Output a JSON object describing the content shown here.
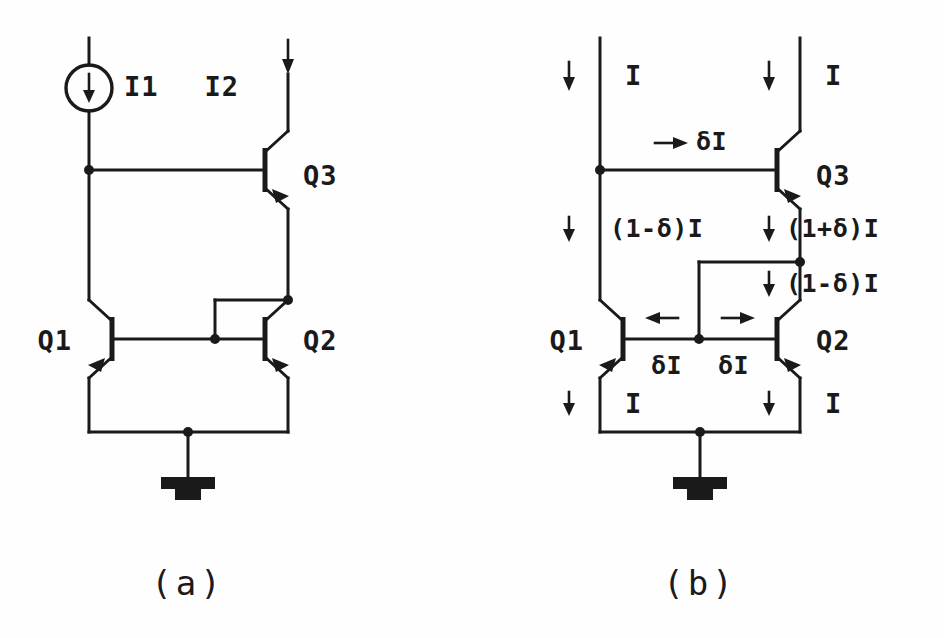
{
  "figure": {
    "background_color": "#ffffff",
    "ink_color": "#1a1a1a"
  },
  "panels": [
    {
      "id": "panel-a",
      "caption": "(a)",
      "devices": [
        {
          "name": "current-source",
          "label": "I1",
          "type": "current-source",
          "arrow": "down"
        },
        {
          "name": "input-branch",
          "label": "I2",
          "type": "input-current",
          "arrow": "down"
        },
        {
          "name": "transistor-q3",
          "label": "Q3",
          "type": "npn"
        },
        {
          "name": "transistor-q1",
          "label": "Q1",
          "type": "npn-mirrored"
        },
        {
          "name": "transistor-q2",
          "label": "Q2",
          "type": "npn"
        },
        {
          "name": "ground",
          "label": "",
          "type": "ground"
        }
      ]
    },
    {
      "id": "panel-b",
      "caption": "(b)",
      "devices": [
        {
          "name": "transistor-q3",
          "label": "Q3",
          "type": "npn"
        },
        {
          "name": "transistor-q1",
          "label": "Q1",
          "type": "npn-mirrored"
        },
        {
          "name": "transistor-q2",
          "label": "Q2",
          "type": "npn"
        },
        {
          "name": "ground",
          "label": "",
          "type": "ground"
        }
      ],
      "current_labels": [
        {
          "name": "current-left-top",
          "text": "I",
          "arrow": "down"
        },
        {
          "name": "current-right-top",
          "text": "I",
          "arrow": "down"
        },
        {
          "name": "current-base-q3",
          "text": "δI",
          "arrow": "right"
        },
        {
          "name": "current-left-mid",
          "text": "(1-δ)I",
          "arrow": "down"
        },
        {
          "name": "current-right-mid",
          "text": "(1+δ)I",
          "arrow": "down"
        },
        {
          "name": "current-right-lower",
          "text": "(1-δ)I",
          "arrow": "down"
        },
        {
          "name": "current-base-q1",
          "text": "δI",
          "arrow": "left"
        },
        {
          "name": "current-base-q2",
          "text": "δI",
          "arrow": "right"
        },
        {
          "name": "current-emitter-left",
          "text": "I",
          "arrow": "down"
        },
        {
          "name": "current-emitter-right",
          "text": "I",
          "arrow": "down"
        }
      ]
    }
  ],
  "labels": {
    "a": {
      "i1": "I1",
      "i2": "I2",
      "q3": "Q3",
      "q1": "Q1",
      "q2": "Q2",
      "caption": "(a)"
    },
    "b": {
      "i_left_top": "I",
      "i_right_top": "I",
      "delta_i_base_q3": "δI",
      "left_mid": "(1-δ)I",
      "right_mid": "(1+δ)I",
      "right_lower": "(1-δ)I",
      "delta_i_left": "δI",
      "delta_i_right": "δI",
      "i_emitter_left": "I",
      "i_emitter_right": "I",
      "q3": "Q3",
      "q1": "Q1",
      "q2": "Q2",
      "caption": "(b)"
    }
  }
}
